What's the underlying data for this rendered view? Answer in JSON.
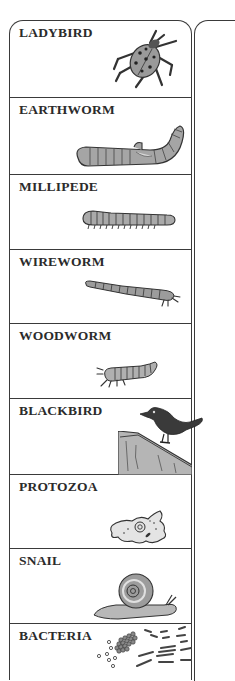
{
  "card": {
    "items": [
      {
        "label": "LADYBIRD",
        "icon": "ladybird-icon"
      },
      {
        "label": "EARTHWORM",
        "icon": "earthworm-icon"
      },
      {
        "label": "MILLIPEDE",
        "icon": "millipede-icon"
      },
      {
        "label": "WIREWORM",
        "icon": "wireworm-icon"
      },
      {
        "label": "WOODWORM",
        "icon": "woodworm-icon"
      },
      {
        "label": "BLACKBIRD",
        "icon": "blackbird-icon"
      },
      {
        "label": "PROTOZOA",
        "icon": "protozoa-icon"
      },
      {
        "label": "SNAIL",
        "icon": "snail-icon"
      },
      {
        "label": "BACTERIA",
        "icon": "bacteria-icon"
      }
    ]
  },
  "colors": {
    "border": "#3a3a3a",
    "text": "#2b2b2b",
    "illustration_fill": "#a8a8a8",
    "illustration_dark": "#3c3c3c"
  }
}
